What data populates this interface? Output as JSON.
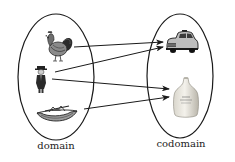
{
  "diagram": {
    "type": "function-mapping",
    "sets": [
      {
        "id": "domain",
        "label": "domain",
        "elements": [
          "rooster",
          "man",
          "boat"
        ]
      },
      {
        "id": "codomain",
        "label": "codomain",
        "elements": [
          "car",
          "jug"
        ]
      }
    ],
    "mappings": [
      {
        "from": "rooster",
        "to": "car"
      },
      {
        "from": "man",
        "to": "car"
      },
      {
        "from": "man",
        "to": "jug"
      },
      {
        "from": "boat",
        "to": "jug"
      }
    ],
    "colors": {
      "stroke": "#1a1a1a",
      "background": "#ffffff"
    }
  },
  "labels": {
    "domain": "domain",
    "codomain": "codomain"
  },
  "icons": {
    "rooster": "rooster-icon",
    "man": "man-icon",
    "boat": "boat-icon",
    "car": "car-icon",
    "jug": "jug-icon"
  }
}
